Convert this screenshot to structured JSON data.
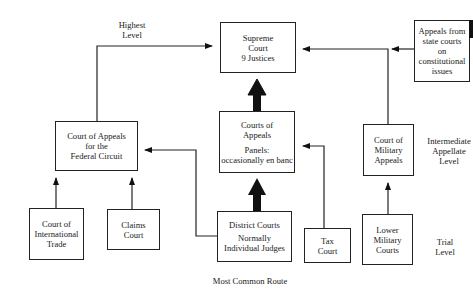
{
  "diagram": {
    "levels": {
      "highest": [
        "Highest",
        "Level"
      ],
      "intermediate": [
        "Intermediate",
        "Appellate",
        "Level"
      ],
      "trial": [
        "Trial",
        "Level"
      ]
    },
    "nodes": {
      "supreme_court": [
        "Supreme",
        "Court",
        "9 Justices"
      ],
      "state_appeals": [
        "Appeals from",
        "state courts",
        "on",
        "constitutional",
        "issues"
      ],
      "federal_circuit": [
        "Court of Appeals",
        "for the",
        "Federal Circuit"
      ],
      "courts_of_appeals": {
        "title": [
          "Courts of",
          "Appeals"
        ],
        "note": [
          "Panels:",
          "occasionally en banc"
        ]
      },
      "military_appeals": [
        "Court of",
        "Military",
        "Appeals"
      ],
      "international_trade": [
        "Court of",
        "International",
        "Trade"
      ],
      "claims_court": [
        "Claims",
        "Court"
      ],
      "district_courts": {
        "title": [
          "District Courts"
        ],
        "note": [
          "Normally",
          "Individual Judges"
        ]
      },
      "tax_court": [
        "Tax",
        "Court"
      ],
      "lower_military": [
        "Lower",
        "Military",
        "Courts"
      ]
    },
    "edges": [
      {
        "from": "federal_circuit",
        "to": "supreme_court"
      },
      {
        "from": "courts_of_appeals",
        "to": "supreme_court",
        "style": "bold"
      },
      {
        "from": "district_courts",
        "to": "courts_of_appeals",
        "style": "bold"
      },
      {
        "from": "district_courts",
        "to": "federal_circuit"
      },
      {
        "from": "international_trade",
        "to": "federal_circuit"
      },
      {
        "from": "claims_court",
        "to": "federal_circuit"
      },
      {
        "from": "tax_court",
        "to": "courts_of_appeals"
      },
      {
        "from": "military_appeals",
        "to": "supreme_court"
      },
      {
        "from": "state_appeals",
        "to": "supreme_court"
      },
      {
        "from": "lower_military",
        "to": "military_appeals"
      }
    ],
    "footer": "Most Common Route"
  }
}
